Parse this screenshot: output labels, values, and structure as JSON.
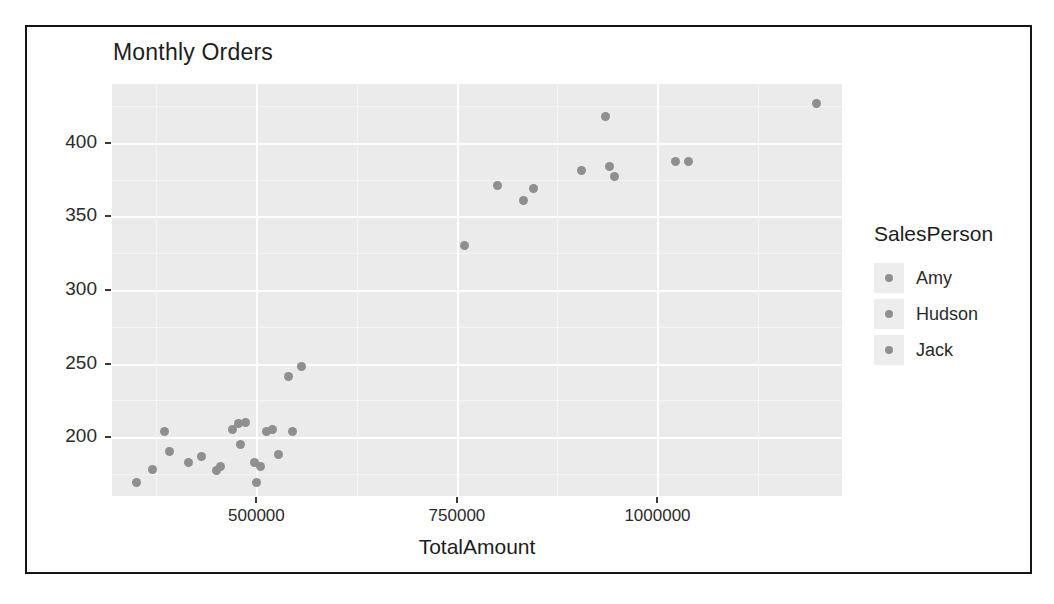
{
  "chart_data": {
    "type": "scatter",
    "title": "Monthly Orders",
    "xlabel": "TotalAmount",
    "ylabel": "OrderCount",
    "xlim": [
      320000,
      1230000
    ],
    "ylim": [
      160,
      440
    ],
    "grid": true,
    "legend_position": "right",
    "legend_title": "SalesPerson",
    "xticks": [
      500000,
      750000,
      1000000
    ],
    "xtick_labels": [
      "500000",
      "750000",
      "1000000"
    ],
    "yticks": [
      200,
      250,
      300,
      350,
      400
    ],
    "ytick_labels": [
      "200",
      "250",
      "300",
      "350",
      "400"
    ],
    "series": [
      {
        "name": "Amy",
        "color": "#8f8f8f",
        "points": [
          [
            350000,
            169
          ],
          [
            370000,
            178
          ],
          [
            385000,
            204
          ],
          [
            392000,
            190
          ],
          [
            432000,
            187
          ],
          [
            455000,
            180
          ],
          [
            470000,
            205
          ]
        ]
      },
      {
        "name": "Hudson",
        "color": "#8f8f8f",
        "points": [
          [
            415000,
            183
          ],
          [
            450000,
            177
          ],
          [
            478000,
            209
          ],
          [
            486000,
            210
          ],
          [
            498000,
            183
          ],
          [
            505000,
            180
          ],
          [
            512000,
            204
          ],
          [
            528000,
            188
          ],
          [
            540000,
            241
          ],
          [
            556000,
            248
          ]
        ]
      },
      {
        "name": "Jack",
        "color": "#8f8f8f",
        "points": [
          [
            480000,
            195
          ],
          [
            500000,
            169
          ],
          [
            520000,
            205
          ],
          [
            545000,
            204
          ],
          [
            760000,
            330
          ],
          [
            800000,
            371
          ],
          [
            833000,
            361
          ],
          [
            845000,
            369
          ],
          [
            905000,
            381
          ],
          [
            935000,
            418
          ],
          [
            940000,
            384
          ],
          [
            947000,
            377
          ],
          [
            1022000,
            387
          ],
          [
            1039000,
            387
          ],
          [
            1198000,
            427
          ]
        ]
      }
    ]
  },
  "legend": {
    "title": "SalesPerson",
    "entries": [
      {
        "label": "Amy"
      },
      {
        "label": "Hudson"
      },
      {
        "label": "Jack"
      }
    ]
  },
  "colors": {
    "panel_background": "#ebebeb",
    "grid_major": "#ffffff",
    "grid_minor": "#f4f4f4",
    "point": "#8f8f8f",
    "text": "#1d1d1d",
    "border": "#151515"
  }
}
